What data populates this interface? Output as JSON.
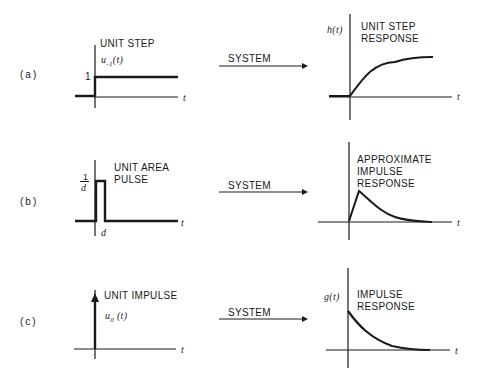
{
  "rows": [
    {
      "label": "(a)",
      "input": {
        "title": "UNIT STEP",
        "symbol": "u",
        "subscript": "-1",
        "arg": "(t)",
        "level_label": "1",
        "axis_label": "t"
      },
      "arrow_label": "SYSTEM",
      "output": {
        "symbol": "h(t)",
        "title_line1": "UNIT  STEP",
        "title_line2": "RESPONSE",
        "axis_label": "t"
      }
    },
    {
      "label": "(b)",
      "input": {
        "title_line1": "UNIT  AREA",
        "title_line2": "PULSE",
        "height_num": "1",
        "height_den": "d",
        "width_label": "d",
        "axis_label": "t"
      },
      "arrow_label": "SYSTEM",
      "output": {
        "title_line1": "APPROXIMATE",
        "title_line2": "IMPULSE",
        "title_line3": "RESPONSE",
        "axis_label": "t"
      }
    },
    {
      "label": "(c)",
      "input": {
        "title": "UNIT  IMPULSE",
        "symbol": "u",
        "subscript": "0",
        "arg": "(t)",
        "axis_label": "t"
      },
      "arrow_label": "SYSTEM",
      "output": {
        "symbol": "g(t)",
        "title_line1": "IMPULSE",
        "title_line2": "RESPONSE",
        "axis_label": "t"
      }
    }
  ]
}
